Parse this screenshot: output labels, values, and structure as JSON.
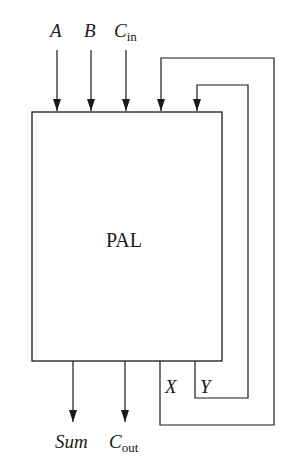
{
  "diagram": {
    "block_label": "PAL",
    "inputs": [
      {
        "name": "A",
        "subscript": ""
      },
      {
        "name": "B",
        "subscript": ""
      },
      {
        "name": "C",
        "subscript": "in"
      }
    ],
    "outputs": [
      {
        "name": "Sum",
        "subscript": ""
      },
      {
        "name": "C",
        "subscript": "out"
      }
    ],
    "feedback": [
      {
        "name": "X"
      },
      {
        "name": "Y"
      }
    ],
    "line_color": "#1a1a1a"
  }
}
